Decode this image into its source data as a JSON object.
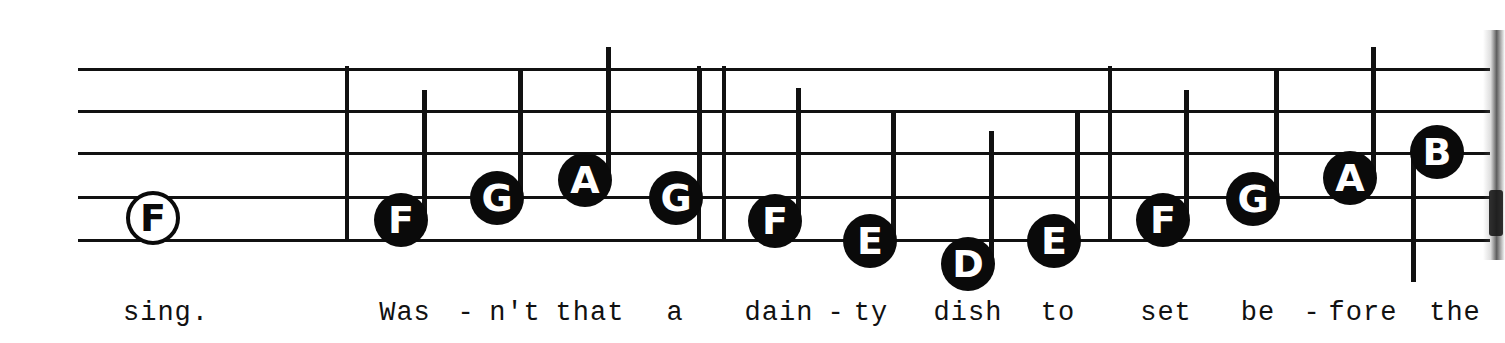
{
  "document": {
    "kind": "music-notation-excerpt",
    "system_label": "single staff with lyrics"
  },
  "staff": {
    "left": 78,
    "right": 1490,
    "line_y": [
      68,
      110,
      152,
      196,
      239
    ],
    "line_thickness": 3,
    "color": "#111111"
  },
  "barlines": [
    {
      "name": "barline-1",
      "x": 345,
      "top": 66,
      "bottom": 242,
      "kind": "single"
    },
    {
      "name": "barline-2a",
      "x": 697,
      "top": 66,
      "bottom": 242,
      "kind": "double-left"
    },
    {
      "name": "barline-2b",
      "x": 722,
      "top": 66,
      "bottom": 242,
      "kind": "double-right"
    },
    {
      "name": "barline-3",
      "x": 1108,
      "top": 66,
      "bottom": 242,
      "kind": "single"
    }
  ],
  "notes": [
    {
      "letter": "F",
      "x": 153,
      "y": 218,
      "head": "hollow",
      "stem": "none",
      "stem_top": 0,
      "stem_bottom": 0
    },
    {
      "letter": "F",
      "x": 401,
      "y": 220,
      "head": "filled",
      "stem": "up",
      "stem_top": 90,
      "stem_bottom": 220
    },
    {
      "letter": "G",
      "x": 497,
      "y": 198,
      "head": "filled",
      "stem": "up",
      "stem_top": 68,
      "stem_bottom": 198
    },
    {
      "letter": "A",
      "x": 585,
      "y": 180,
      "head": "filled",
      "stem": "up",
      "stem_top": 47,
      "stem_bottom": 180
    },
    {
      "letter": "G",
      "x": 676,
      "y": 198,
      "head": "filled",
      "stem": "up",
      "stem_top": 68,
      "stem_bottom": 198
    },
    {
      "letter": "F",
      "x": 775,
      "y": 221,
      "head": "filled",
      "stem": "up",
      "stem_top": 88,
      "stem_bottom": 221
    },
    {
      "letter": "E",
      "x": 870,
      "y": 241,
      "head": "filled",
      "stem": "up",
      "stem_top": 112,
      "stem_bottom": 241
    },
    {
      "letter": "D",
      "x": 968,
      "y": 264,
      "head": "filled",
      "stem": "up",
      "stem_top": 131,
      "stem_bottom": 264
    },
    {
      "letter": "E",
      "x": 1054,
      "y": 241,
      "head": "filled",
      "stem": "up",
      "stem_top": 112,
      "stem_bottom": 241
    },
    {
      "letter": "F",
      "x": 1163,
      "y": 220,
      "head": "filled",
      "stem": "up",
      "stem_top": 90,
      "stem_bottom": 220
    },
    {
      "letter": "G",
      "x": 1253,
      "y": 199,
      "head": "filled",
      "stem": "up",
      "stem_top": 68,
      "stem_bottom": 199
    },
    {
      "letter": "A",
      "x": 1350,
      "y": 178,
      "head": "filled",
      "stem": "up",
      "stem_top": 47,
      "stem_bottom": 178
    },
    {
      "letter": "B",
      "x": 1437,
      "y": 152,
      "head": "filled",
      "stem": "down",
      "stem_top": 152,
      "stem_bottom": 282
    }
  ],
  "lyrics": [
    {
      "text": "sing.",
      "x": 166
    },
    {
      "text": "Was",
      "x": 405
    },
    {
      "text": "-",
      "x": 466
    },
    {
      "text": "n't",
      "x": 515
    },
    {
      "text": "that",
      "x": 590
    },
    {
      "text": "a",
      "x": 675
    },
    {
      "text": "dain",
      "x": 779
    },
    {
      "text": "-",
      "x": 836
    },
    {
      "text": "ty",
      "x": 871
    },
    {
      "text": "dish",
      "x": 968
    },
    {
      "text": "to",
      "x": 1058
    },
    {
      "text": "set",
      "x": 1166
    },
    {
      "text": "be",
      "x": 1258
    },
    {
      "text": "-",
      "x": 1312
    },
    {
      "text": "fore",
      "x": 1363
    },
    {
      "text": "the",
      "x": 1455
    }
  ],
  "lyrics_baseline_y": 298,
  "lyrics_full_line": "sing.  Was - n't  that  a  dain - ty  dish  to  set  be - fore  the"
}
